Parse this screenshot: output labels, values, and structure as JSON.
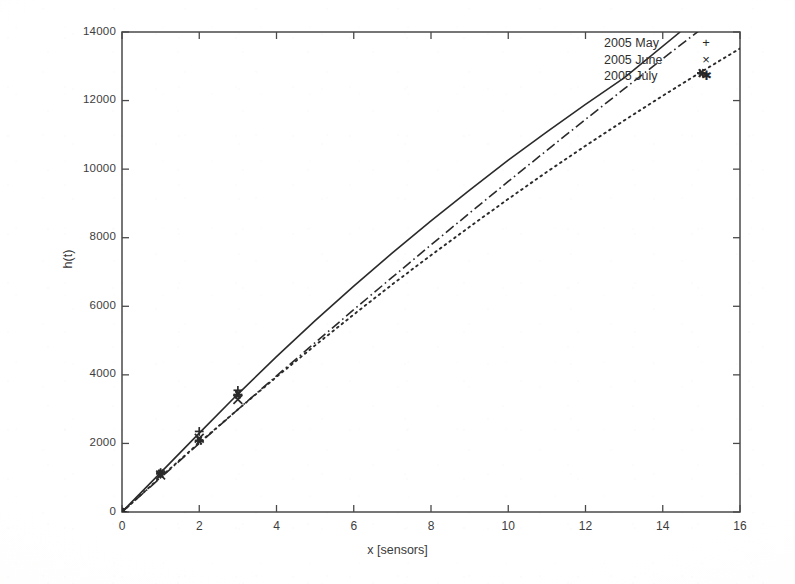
{
  "chart_data": {
    "type": "line",
    "title": "",
    "xlabel": "x [sensors]",
    "ylabel": "h(t)",
    "xlim": [
      0,
      16
    ],
    "ylim": [
      0,
      14000
    ],
    "xticks": [
      0,
      2,
      4,
      6,
      8,
      10,
      12,
      14,
      16
    ],
    "yticks": [
      0,
      2000,
      4000,
      6000,
      8000,
      10000,
      12000,
      14000
    ],
    "xtick_labels": [
      "0",
      "2",
      "4",
      "6",
      "8",
      "10",
      "12",
      "14",
      "16"
    ],
    "ytick_labels": [
      "0",
      "2000",
      "4000",
      "6000",
      "8000",
      "10000",
      "12000",
      "14000"
    ],
    "grid": false,
    "legend_position": "top-right inside",
    "tick_direction": "in",
    "frame": "full box",
    "series": [
      {
        "name": "2005 May",
        "linestyle": "solid",
        "marker": "+",
        "color": "#2b2b2b",
        "x": [
          0,
          1,
          2,
          3,
          15
        ],
        "values": [
          0,
          1150,
          2350,
          3550,
          15600
        ],
        "fit_x": [
          0,
          1,
          2,
          3,
          4,
          5,
          6,
          7,
          8,
          9,
          10,
          11,
          12,
          13,
          14.45
        ],
        "fit_y": [
          0,
          1150,
          2300,
          3440,
          4530,
          5580,
          6590,
          7560,
          8490,
          9390,
          10260,
          11090,
          11890,
          12660,
          14000
        ],
        "measured_x": [
          0,
          1,
          2,
          3
        ],
        "measured_y": [
          0,
          1150,
          2350,
          3550
        ],
        "clipped_at_top": true
      },
      {
        "name": "2005 June",
        "linestyle": "dash-dot",
        "marker": "x",
        "color": "#2b2b2b",
        "x": [
          0,
          1,
          2,
          3,
          15
        ],
        "values": [
          0,
          1080,
          2150,
          3280,
          13400
        ],
        "fit_x": [
          0,
          1,
          2,
          3,
          4,
          5,
          6,
          7,
          8,
          9,
          10,
          11,
          12,
          13,
          14,
          15
        ],
        "fit_y": [
          0,
          1000,
          2000,
          2990,
          3970,
          4940,
          5900,
          6850,
          7790,
          8720,
          9640,
          10550,
          11450,
          12340,
          13220,
          14090
        ],
        "measured_x": [
          0,
          1,
          2,
          3
        ],
        "measured_y": [
          0,
          1080,
          2150,
          3280
        ],
        "clipped_at_top": true
      },
      {
        "name": "2005 July",
        "linestyle": "dotted",
        "marker": "*",
        "color": "#2b2b2b",
        "x": [
          0,
          1,
          2,
          3,
          15
        ],
        "values": [
          0,
          1120,
          2080,
          3420,
          12800
        ],
        "fit_x": [
          0,
          1,
          2,
          3,
          4,
          5,
          6,
          7,
          8,
          9,
          10,
          11,
          12,
          13,
          14,
          15,
          16
        ],
        "fit_y": [
          0,
          1020,
          2020,
          2990,
          3940,
          4860,
          5760,
          6640,
          7490,
          8320,
          9130,
          9920,
          10680,
          11420,
          12140,
          12840,
          13520
        ],
        "measured_x": [
          0,
          1,
          2,
          3,
          15
        ],
        "measured_y": [
          0,
          1120,
          2080,
          3420,
          12800
        ],
        "clipped_at_top": false
      }
    ]
  },
  "legend": {
    "entries": [
      {
        "label": "2005 May",
        "key": "+"
      },
      {
        "label": "2005 June",
        "key": "×"
      },
      {
        "label": "2005 July",
        "key": "✱"
      }
    ]
  }
}
